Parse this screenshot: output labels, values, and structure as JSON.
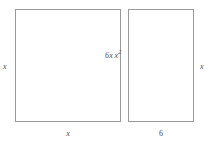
{
  "figure": {
    "background_color": "#ffffff",
    "stroke_color": "#9a9a9a",
    "text_color": "#4a4a4a"
  },
  "shapes": {
    "square": {
      "name": "large-square",
      "area_label_base": "x",
      "area_label_exponent": "2",
      "width_label": "x",
      "height_label": "x"
    },
    "strip": {
      "name": "right-rectangle",
      "area_label": "6x",
      "width_label": "6",
      "height_label": "x"
    }
  },
  "dimensions": {
    "left_height": "x",
    "right_height": "x",
    "bottom_left_width": "x",
    "bottom_right_width": "6"
  },
  "chart_data": {
    "type": "bar",
    "categories": [
      "x²",
      "6x"
    ],
    "values": [
      106,
      66
    ],
    "xlabel": "",
    "ylabel": "",
    "annotations": [
      "x",
      "x",
      "x",
      "6"
    ]
  }
}
